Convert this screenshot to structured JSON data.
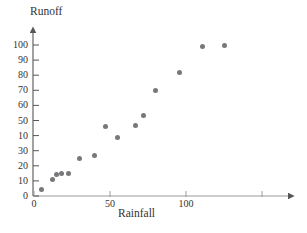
{
  "figure": {
    "cut_header_fragment": "",
    "marker_color": "#78787c",
    "axis_color": "#55555a"
  },
  "chart_data": {
    "type": "scatter",
    "title": "",
    "xlabel": "Rainfall",
    "ylabel": "Runoff",
    "xlim": [
      0,
      150
    ],
    "ylim": [
      0,
      105
    ],
    "grid": false,
    "legend": null,
    "xticks": [
      0,
      50,
      100,
      150
    ],
    "xtick_labels": [
      "0",
      "50",
      "100",
      ""
    ],
    "yticks": [
      0,
      10,
      20,
      30,
      40,
      50,
      60,
      70,
      80,
      90,
      100
    ],
    "ytick_labels": [
      "0",
      "10",
      "20",
      "30",
      "10",
      "50",
      "60",
      "70",
      "80",
      "90",
      "100"
    ],
    "points": [
      {
        "x": 5,
        "y": 4
      },
      {
        "x": 12,
        "y": 11
      },
      {
        "x": 15,
        "y": 14
      },
      {
        "x": 18,
        "y": 15
      },
      {
        "x": 23,
        "y": 15
      },
      {
        "x": 30,
        "y": 25
      },
      {
        "x": 40,
        "y": 27
      },
      {
        "x": 47,
        "y": 46
      },
      {
        "x": 55,
        "y": 39
      },
      {
        "x": 67,
        "y": 47
      },
      {
        "x": 72,
        "y": 53
      },
      {
        "x": 80,
        "y": 70
      },
      {
        "x": 96,
        "y": 82
      },
      {
        "x": 111,
        "y": 99
      },
      {
        "x": 125,
        "y": 100
      }
    ]
  }
}
